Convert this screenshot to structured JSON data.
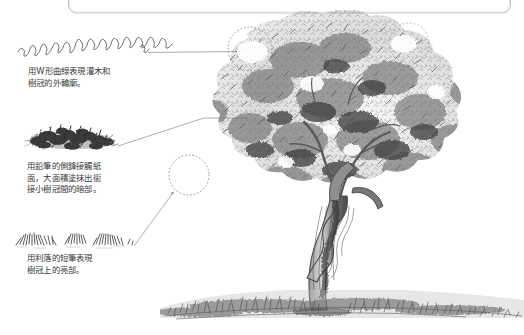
{
  "page": {
    "kind": "pencil-drawing-tutorial-illustration",
    "background_color": "#ffffff",
    "ink_color": "#4a4a4a",
    "caption_color": "#3b3b3b",
    "width": 524,
    "height": 335
  },
  "top_frame": {
    "name": "rounded-rectangle-frame-bottom-edge",
    "stroke_color": "#bfbfbf",
    "x": 68,
    "y": -46,
    "width": 442,
    "height": 60,
    "corner_radius": 8
  },
  "annotations": [
    {
      "id": "w-curve",
      "sketch_name": "w-shaped-scribble-line-sketch",
      "caption": "用W形曲線表現灌木和\n樹冠的外輪廓。",
      "leader": {
        "type": "horizontal",
        "from_x": 148,
        "from_y": 52,
        "to_x": 236,
        "to_y": 52
      },
      "target_circle": {
        "cx": 249,
        "cy": 49,
        "r": 22
      }
    },
    {
      "id": "side-of-pencil-mass",
      "sketch_name": "dark-shrub-mass-sketch",
      "caption": "用鉛筆的側鋒接觸紙\n面，大面積塗抹出銜\n接小樹冠間的暗部。",
      "leader": {
        "type": "diagonal",
        "from_x": 118,
        "from_y": 146,
        "to_x": 205,
        "to_y": 118
      },
      "target_circle": {
        "cx": 188,
        "cy": 175,
        "r": 20
      }
    },
    {
      "id": "short-crisp-strokes",
      "sketch_name": "short-grass-strokes-sketch",
      "caption": "用利落的短筆表現\n樹冠上的亮部。",
      "leader": {
        "type": "diagonal",
        "from_x": 134,
        "from_y": 246,
        "to_x": 173,
        "to_y": 193
      },
      "target_circle": null
    }
  ],
  "drawing": {
    "name": "pencil-drawn-tree",
    "subject": "tree-with-forked-zigzag-trunk-on-grassy-ground",
    "canopy": {
      "x": 195,
      "y": 18,
      "width": 320,
      "height": 210
    },
    "trunk": {
      "x": 295,
      "y": 185,
      "width": 110,
      "height": 125
    },
    "ground": {
      "x": 160,
      "y": 288,
      "width": 364,
      "height": 32
    }
  }
}
